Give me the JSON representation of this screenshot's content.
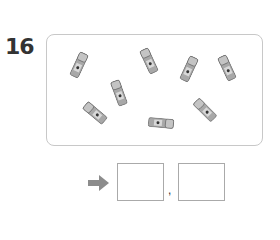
{
  "question": {
    "number": "16",
    "object_icon": "glue-stick-icon",
    "object_count": 8,
    "sticks": [
      {
        "x": 74,
        "y": 52,
        "angle": 25
      },
      {
        "x": 114,
        "y": 80,
        "angle": -20
      },
      {
        "x": 144,
        "y": 48,
        "angle": -25
      },
      {
        "x": 184,
        "y": 56,
        "angle": 25
      },
      {
        "x": 222,
        "y": 55,
        "angle": -25
      },
      {
        "x": 90,
        "y": 100,
        "angle": -50
      },
      {
        "x": 156,
        "y": 110,
        "angle": 95
      },
      {
        "x": 200,
        "y": 97,
        "angle": -45
      }
    ]
  },
  "answer": {
    "arrow_icon": "right-arrow-icon",
    "box1_value": "",
    "box2_value": "",
    "separator": ","
  },
  "colors": {
    "frame_border": "#c8c8c8",
    "stick_body": "#9a9a9a",
    "arrow": "#8c8c8c"
  }
}
